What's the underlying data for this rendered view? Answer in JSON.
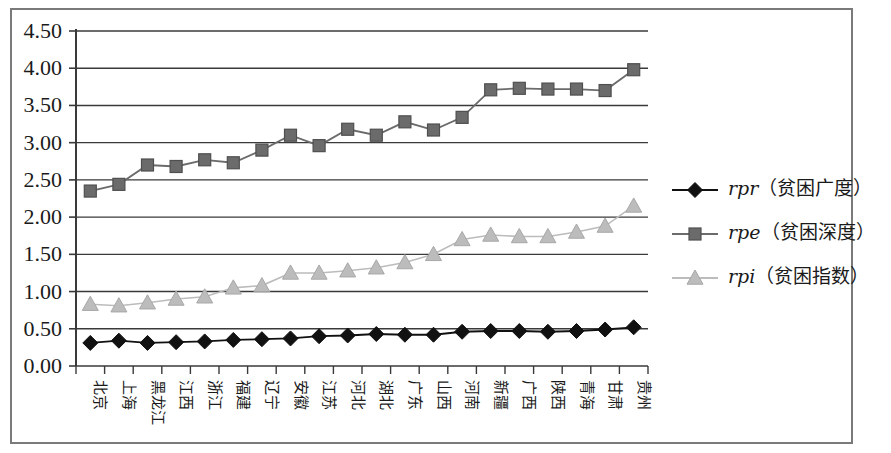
{
  "chart_data": {
    "type": "line",
    "title": "",
    "subtitle": "",
    "xlabel": "",
    "ylabel": "",
    "ylim": [
      0.0,
      4.5
    ],
    "ytick_step": 0.5,
    "ytick_labels": [
      "0.00",
      "0.50",
      "1.00",
      "1.50",
      "2.00",
      "2.50",
      "3.00",
      "3.50",
      "4.00",
      "4.50"
    ],
    "ytick_values": [
      0.0,
      0.5,
      1.0,
      1.5,
      2.0,
      2.5,
      3.0,
      3.5,
      4.0,
      4.5
    ],
    "grid": true,
    "grid_axis": "y",
    "legend_position": "right",
    "categories": [
      "北京",
      "上海",
      "黑龙江",
      "江西",
      "浙江",
      "福建",
      "辽宁",
      "安徽",
      "江苏",
      "河北",
      "湖北",
      "广东",
      "山西",
      "河南",
      "新疆",
      "广西",
      "陕西",
      "青海",
      "甘肃",
      "贵州"
    ],
    "series": [
      {
        "name": "rpr（贫困广度）",
        "symbol": "rpr",
        "cn_name": "贫困广度",
        "marker": "diamond",
        "color": "#111111",
        "values": [
          0.31,
          0.34,
          0.31,
          0.32,
          0.33,
          0.35,
          0.36,
          0.37,
          0.4,
          0.41,
          0.43,
          0.42,
          0.42,
          0.46,
          0.47,
          0.47,
          0.46,
          0.47,
          0.49,
          0.52
        ]
      },
      {
        "name": "rpe（贫困深度）",
        "symbol": "rpe",
        "cn_name": "贫困深度",
        "marker": "square",
        "color": "#6b6b6b",
        "values": [
          2.35,
          2.44,
          2.7,
          2.68,
          2.77,
          2.73,
          2.9,
          3.1,
          2.96,
          3.18,
          3.1,
          3.28,
          3.17,
          3.34,
          3.71,
          3.73,
          3.72,
          3.72,
          3.7,
          3.98
        ]
      },
      {
        "name": "rpi（贫困指数）",
        "symbol": "rpi",
        "cn_name": "贫困指数",
        "marker": "triangle",
        "color": "#bcbcbc",
        "values": [
          0.83,
          0.81,
          0.85,
          0.9,
          0.93,
          1.05,
          1.08,
          1.25,
          1.25,
          1.28,
          1.32,
          1.39,
          1.5,
          1.7,
          1.76,
          1.74,
          1.74,
          1.8,
          1.88,
          2.15
        ]
      }
    ]
  },
  "legend": {
    "items": [
      {
        "symbol": "rpr",
        "paren_open": "（",
        "cn": "贫困广度",
        "paren_close": "）"
      },
      {
        "symbol": "rpe",
        "paren_open": "（",
        "cn": "贫困深度",
        "paren_close": "）"
      },
      {
        "symbol": "rpi",
        "paren_open": "（",
        "cn": "贫困指数",
        "paren_close": "）"
      }
    ]
  },
  "colors": {
    "frame": "#7a7a7a",
    "axis": "#3a3a3a",
    "grid": "#3a3a3a",
    "rpr": "#111111",
    "rpe": "#6b6b6b",
    "rpi": "#bcbcbc",
    "background": "#ffffff"
  }
}
